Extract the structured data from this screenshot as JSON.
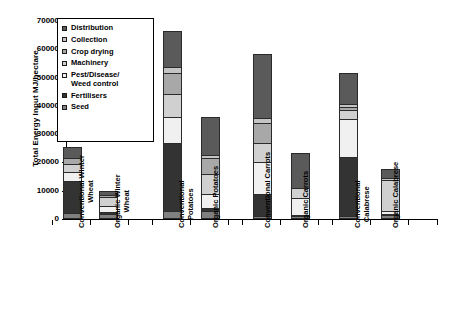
{
  "chart_data": {
    "type": "bar",
    "subtype": "stacked",
    "title": "",
    "xlabel": "",
    "ylabel": "Total Energy Input MJ/hectare",
    "ylim": [
      0,
      70000
    ],
    "ytick_values": [
      0,
      10000,
      20000,
      30000,
      40000,
      50000,
      60000,
      70000
    ],
    "ytick_labels": [
      "0",
      "10000",
      "20000",
      "30000",
      "40000",
      "50000",
      "60000",
      "70000"
    ],
    "grid": false,
    "legend_position": "upper-left-inside",
    "categories": [
      "Conventional Winter Wheat",
      "Organic Winter Wheat",
      "Conventional Potatoes",
      "Organic Potatoes",
      "Conventional Carrots",
      "Organic Carrots",
      "Conventional Calabrese",
      "Organic Calabrese"
    ],
    "category_lines": [
      [
        "Conventional Winter",
        "Wheat"
      ],
      [
        "Organic Winter",
        "Wheat"
      ],
      [
        "Conventional",
        "Potatoes"
      ],
      [
        "Organic Potatoes"
      ],
      [
        "Conventional Carrots"
      ],
      [
        "Organic Carrots"
      ],
      [
        "Conventional",
        "Calabrese"
      ],
      [
        "Organic Calabrese"
      ]
    ],
    "series": [
      {
        "name": "Seed",
        "color": "#808080",
        "values": [
          1500,
          1200,
          2300,
          2300,
          500,
          400,
          300,
          700
        ]
      },
      {
        "name": "Fertilisers",
        "color": "#333333",
        "values": [
          11500,
          800,
          24000,
          1000,
          7800,
          500,
          21200,
          400
        ]
      },
      {
        "name": "Pest/Disease/Weed control",
        "color": "#f0f0f0",
        "values": [
          3500,
          2200,
          9500,
          5000,
          11500,
          5900,
          13800,
          1000
        ]
      },
      {
        "name": "Machinery",
        "color": "#d0d0d0",
        "values": [
          2800,
          3300,
          8200,
          7200,
          6600,
          3700,
          3000,
          11500
        ]
      },
      {
        "name": "Crop drying",
        "color": "#a8a8a8",
        "values": [
          2200,
          800,
          7500,
          5800,
          7200,
          0,
          1200,
          0
        ]
      },
      {
        "name": "Collection",
        "color": "#c4c4c4",
        "values": [
          0,
          0,
          2000,
          1200,
          1800,
          0,
          1000,
          700
        ]
      },
      {
        "name": "Distribution",
        "color": "#5a5a5a",
        "values": [
          4000,
          1700,
          13000,
          13500,
          23000,
          12900,
          11000,
          3300
        ]
      }
    ],
    "totals": [
      25500,
      10000,
      66500,
      36000,
      58400,
      23400,
      51500,
      17600
    ]
  },
  "legend": {
    "items": [
      {
        "label": "Distribution",
        "lines": [
          "Distribution"
        ],
        "color": "#5a5a5a"
      },
      {
        "label": "Collection",
        "lines": [
          "Collection"
        ],
        "color": "#c4c4c4"
      },
      {
        "label": "Crop drying",
        "lines": [
          "Crop drying"
        ],
        "color": "#a8a8a8"
      },
      {
        "label": "Machinery",
        "lines": [
          "Machinery"
        ],
        "color": "#d0d0d0"
      },
      {
        "label": "Pest/Disease/Weed control",
        "lines": [
          "Pest/Disease/",
          "Weed control"
        ],
        "color": "#f0f0f0"
      },
      {
        "label": "Fertilisers",
        "lines": [
          "Fertilisers"
        ],
        "color": "#333333"
      },
      {
        "label": "Seed",
        "lines": [
          "Seed"
        ],
        "color": "#808080"
      }
    ]
  }
}
